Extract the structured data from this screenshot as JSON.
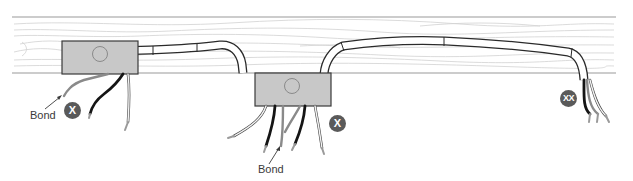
{
  "diagram": {
    "colors": {
      "joist_fill": "#ffffff",
      "joist_edge": "#9a9a9a",
      "grain": "#cfcfcf",
      "box_fill": "#c8c8c8",
      "box_edge": "#3a3a3a",
      "cable_edge": "#2a2a2a",
      "wire_black": "#151515",
      "wire_gray": "#8a8a8a",
      "wire_white": "#f4f4f4",
      "badge": "#5a5a5a"
    },
    "junction_boxes": [
      {
        "id": "box-1",
        "knockout": true
      },
      {
        "id": "box-2",
        "knockout": true
      }
    ],
    "labels": {
      "bond_left": "Bond",
      "bond_center": "Bond"
    },
    "badges": {
      "left": "X",
      "center": "X",
      "right": "XX"
    }
  }
}
